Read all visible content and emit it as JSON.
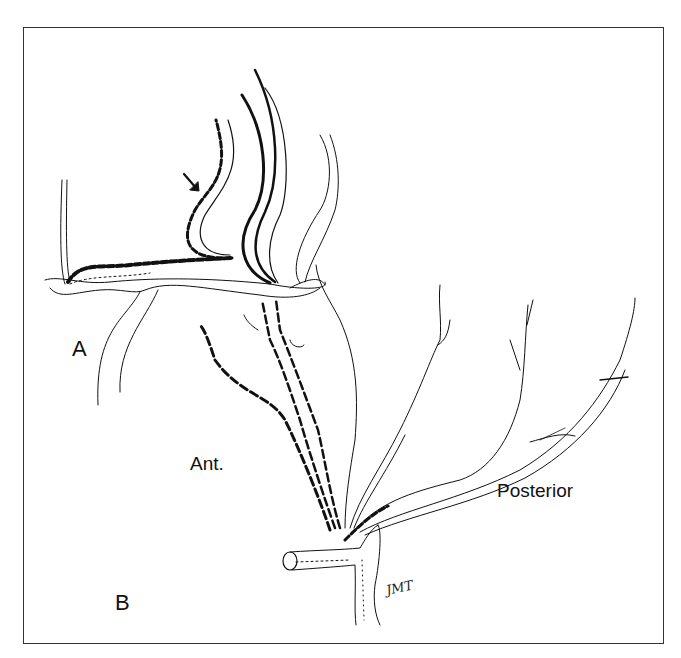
{
  "figure": {
    "panels": [
      {
        "id": "A",
        "label": "A"
      },
      {
        "id": "B",
        "label": "B"
      }
    ],
    "annotations": {
      "anterior": "Ant.",
      "posterior": "Posterior",
      "signature": "JMT"
    },
    "icons": {
      "arrow": "arrow-down-right-icon"
    },
    "colors": {
      "ink": "#111111",
      "background": "#ffffff",
      "border": "#333333"
    }
  }
}
